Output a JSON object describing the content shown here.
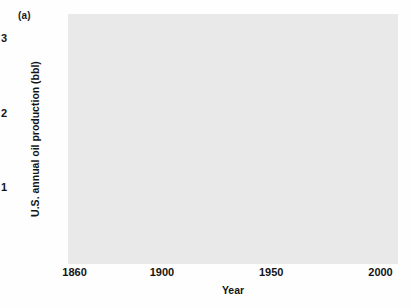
{
  "panel": {
    "label": "(a)"
  },
  "chart_data": {
    "type": "scatter",
    "title": "",
    "subtitle": "",
    "xlabel": "Year",
    "ylabel": "U.S. annual oil production (bbl)",
    "xlim": [
      1857,
      2008
    ],
    "ylim": [
      0,
      3.35
    ],
    "xticks": [
      1860,
      1900,
      1950,
      2000
    ],
    "xticklabels": [
      "1860",
      "1900",
      "1950",
      "2000"
    ],
    "yticks": [
      1,
      2,
      3
    ],
    "yticklabels": [
      "1",
      "2",
      "3"
    ],
    "grid": true,
    "legend": null,
    "plot_bg": "#e9e9e9",
    "grid_color": "#c2c2c2",
    "point_color": "#4a4a4a",
    "curve_color": "#555555",
    "series": [
      {
        "name": "U.S. annual oil production (observed)",
        "type": "scatter",
        "x": [
          1860,
          1862,
          1864,
          1866,
          1868,
          1870,
          1872,
          1874,
          1876,
          1878,
          1880,
          1882,
          1884,
          1886,
          1888,
          1890,
          1892,
          1894,
          1896,
          1898,
          1900,
          1902,
          1904,
          1906,
          1908,
          1910,
          1912,
          1914,
          1916,
          1918,
          1920,
          1922,
          1924,
          1926,
          1927,
          1928,
          1929,
          1930,
          1931,
          1932,
          1933,
          1934,
          1935,
          1936,
          1937,
          1938,
          1939,
          1940,
          1941,
          1942,
          1943,
          1944,
          1945,
          1946,
          1947,
          1948,
          1949,
          1950,
          1951,
          1952,
          1953,
          1954,
          1955,
          1956,
          1957,
          1958,
          1959,
          1960,
          1961,
          1962,
          1963,
          1964,
          1965,
          1966,
          1967,
          1968,
          1969,
          1970,
          1971,
          1972,
          1973,
          1974,
          1975,
          1976,
          1977,
          1978,
          1979,
          1980,
          1981,
          1982,
          1983,
          1984,
          1985,
          1986,
          1987,
          1988,
          1989,
          1990,
          1991,
          1992,
          1993,
          1994,
          1995,
          1996,
          1998,
          2000,
          2002,
          2004,
          2006
        ],
        "y": [
          0.01,
          0.01,
          0.02,
          0.02,
          0.02,
          0.02,
          0.03,
          0.03,
          0.03,
          0.03,
          0.04,
          0.04,
          0.04,
          0.04,
          0.05,
          0.05,
          0.05,
          0.05,
          0.06,
          0.06,
          0.06,
          0.09,
          0.12,
          0.13,
          0.18,
          0.21,
          0.22,
          0.27,
          0.3,
          0.36,
          0.44,
          0.56,
          0.71,
          0.77,
          0.9,
          0.9,
          1.01,
          0.9,
          0.85,
          0.78,
          0.91,
          0.91,
          1.0,
          1.1,
          1.28,
          1.21,
          1.26,
          1.35,
          1.4,
          1.39,
          1.51,
          1.68,
          1.71,
          1.73,
          1.86,
          2.02,
          1.84,
          1.97,
          2.25,
          2.29,
          2.36,
          2.32,
          2.48,
          2.62,
          2.62,
          2.45,
          2.57,
          2.57,
          2.62,
          2.68,
          2.75,
          2.79,
          2.85,
          3.03,
          3.22,
          3.33,
          3.2,
          3.52,
          3.45,
          3.46,
          3.36,
          3.2,
          3.06,
          2.97,
          3.01,
          3.18,
          3.12,
          3.15,
          3.13,
          3.16,
          3.17,
          3.25,
          3.27,
          3.17,
          3.05,
          2.98,
          2.78,
          2.68,
          2.71,
          2.62,
          2.5,
          2.43,
          2.39,
          2.37,
          2.28,
          2.13,
          2.1,
          1.98,
          1.86
        ],
        "marker": "dot",
        "marker_size": 2.1
      },
      {
        "name": "Hubbert fitted curve",
        "type": "line",
        "x": [
          1860,
          1870,
          1880,
          1890,
          1900,
          1905,
          1910,
          1915,
          1920,
          1925,
          1930,
          1935,
          1940,
          1945,
          1950,
          1955,
          1960,
          1965,
          1970,
          1972,
          1974,
          1976,
          1978,
          1980,
          1982,
          1984,
          1986,
          1988,
          1990,
          1992,
          1994,
          1996,
          1998,
          2000,
          2002,
          2004,
          2006
        ],
        "y": [
          0.01,
          0.02,
          0.03,
          0.05,
          0.07,
          0.1,
          0.16,
          0.24,
          0.38,
          0.56,
          0.78,
          1.02,
          1.3,
          1.6,
          1.92,
          2.24,
          2.52,
          2.74,
          2.92,
          2.97,
          3.0,
          3.02,
          3.02,
          3.0,
          2.96,
          2.89,
          2.8,
          2.7,
          2.6,
          2.49,
          2.38,
          2.27,
          2.16,
          2.05,
          1.98,
          1.92,
          1.88
        ],
        "line_width": 1.6
      }
    ],
    "annotations": [
      {
        "text": "(a)",
        "position": "top-left-outside"
      }
    ]
  }
}
